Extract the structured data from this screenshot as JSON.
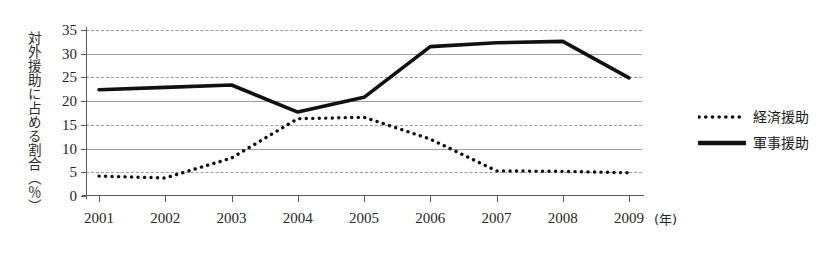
{
  "chart_data": {
    "type": "line",
    "title": "",
    "xlabel": "(年)",
    "ylabel": "対外援助に占める割合（％）",
    "x": [
      2001,
      2002,
      2003,
      2004,
      2005,
      2006,
      2007,
      2008,
      2009
    ],
    "categories": [
      "2001",
      "2002",
      "2003",
      "2004",
      "2005",
      "2006",
      "2007",
      "2008",
      "2009"
    ],
    "xlim": [
      2001,
      2009
    ],
    "ylim": [
      0,
      35
    ],
    "yticks": [
      0,
      5,
      10,
      15,
      20,
      25,
      30,
      35
    ],
    "ytick_labels": [
      "0",
      "5",
      "10",
      "15",
      "20",
      "25",
      "30",
      "35"
    ],
    "grid": true,
    "grid_axis": "y",
    "legend_position": "right",
    "series": [
      {
        "name": "経済援助",
        "style": "dotted",
        "color": "#111111",
        "values": [
          4.2,
          3.8,
          8.0,
          16.3,
          16.6,
          12.0,
          5.3,
          5.2,
          4.9
        ]
      },
      {
        "name": "軍事援助",
        "style": "solid",
        "color": "#111111",
        "values": [
          22.4,
          22.9,
          23.4,
          17.7,
          20.8,
          31.5,
          32.3,
          32.6,
          24.9
        ]
      }
    ]
  },
  "legend": {
    "items": [
      {
        "label": "経済援助",
        "style": "dotted"
      },
      {
        "label": "軍事援助",
        "style": "solid"
      }
    ]
  },
  "axes": {
    "x_unit": "(年)",
    "y_caption": "対外援助に占める割合（％）"
  }
}
